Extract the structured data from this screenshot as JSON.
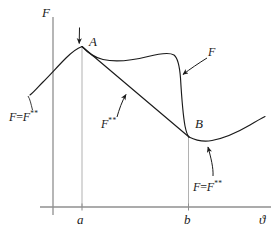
{
  "figure": {
    "type": "free-energy-vs-temperature-diagram",
    "background_color": "#ffffff",
    "ink_color": "#1a1a1a",
    "guide_color": "#9a9a9a",
    "axes": {
      "y_axis_label": "F",
      "x_axis_label": "ϑ",
      "x_ticks": [
        {
          "label": "a"
        },
        {
          "label": "b"
        }
      ]
    },
    "points": [
      {
        "label": "A"
      },
      {
        "label": "B"
      }
    ],
    "annotations": [
      {
        "name": "left-branch",
        "text_prefix": "F",
        "text_eq": "=",
        "text_base": "F",
        "text_sup": "**"
      },
      {
        "name": "convex-envelope",
        "text_base": "F",
        "text_sup": "**"
      },
      {
        "name": "upper-curve",
        "text_base": "F",
        "text_sup": ""
      },
      {
        "name": "right-branch",
        "text_prefix": "F",
        "text_eq": "=",
        "text_base": "F",
        "text_sup": "**"
      }
    ]
  },
  "labels": {
    "y_axis": "F",
    "x_axis": "ϑ",
    "tick_a": "a",
    "tick_b": "b",
    "point_a": "A",
    "point_b": "B",
    "left_F": "F",
    "left_eq": "=",
    "left_F2": "F",
    "left_sup": "**",
    "mid_F": "F",
    "mid_sup": "**",
    "curve_F": "F",
    "right_F": "F",
    "right_eq": "=",
    "right_F2": "F",
    "right_sup": "**"
  }
}
